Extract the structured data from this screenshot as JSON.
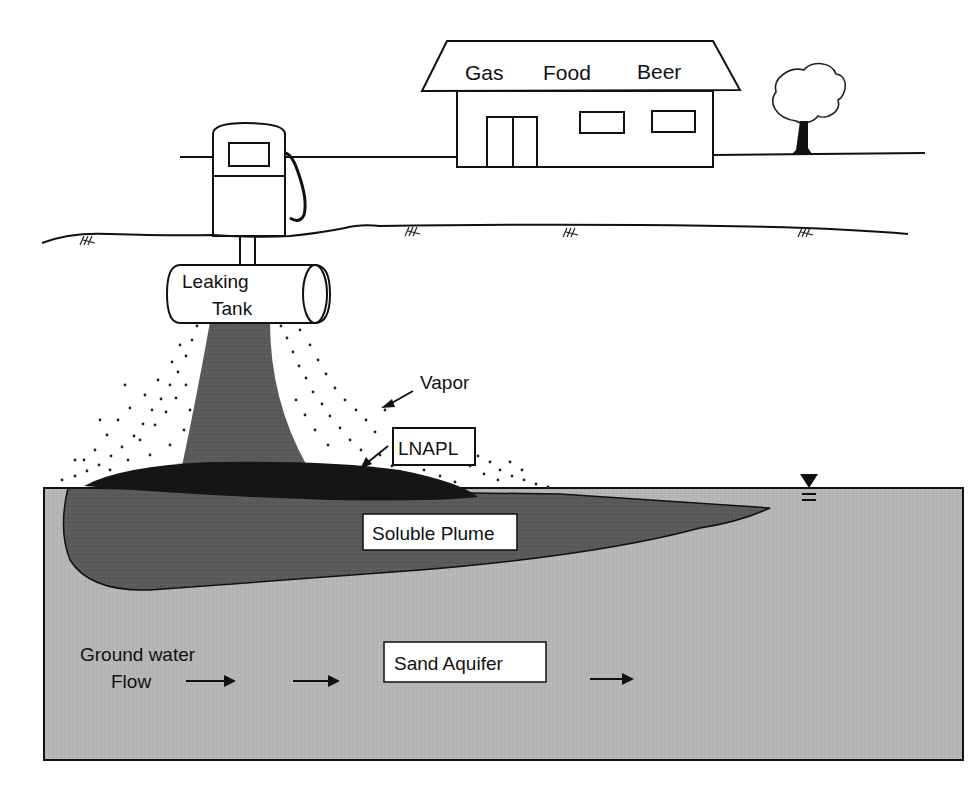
{
  "diagram": {
    "type": "cross-section schematic"
  },
  "building": {
    "sign": [
      "Gas",
      "Food",
      "Beer"
    ]
  },
  "labels": {
    "tank_line1": "Leaking",
    "tank_line2": "Tank",
    "vapor": "Vapor",
    "lnapl": "LNAPL",
    "soluble_plume": "Soluble Plume",
    "groundwater_line1": "Ground water",
    "groundwater_line2": "Flow",
    "aquifer": "Sand Aquifer"
  },
  "symbols": {
    "water_table": "water-table-triangle",
    "flow_arrows": 4
  },
  "colors": {
    "aquifer": "#b4b4b4",
    "plume": "#5a5a5a",
    "lnapl": "#151515",
    "leak_column": "#555555",
    "line": "#111111",
    "background": "#ffffff"
  }
}
